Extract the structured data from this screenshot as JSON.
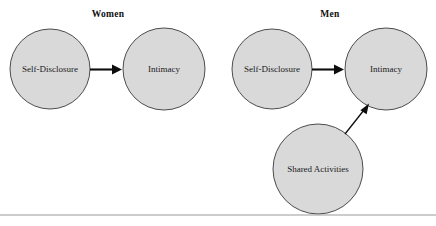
{
  "figure": {
    "background_color": "#ffffff",
    "node_fill_color": "#d9d9d9",
    "node_stroke_color": "#3a3a3a",
    "arrow_color": "#0d0d0d",
    "rule_color": "#9a9a9a"
  },
  "panels": [
    {
      "key": "women",
      "title": "Women",
      "nodes": [
        {
          "key": "self_disclosure",
          "label": "Self-Disclosure"
        },
        {
          "key": "intimacy",
          "label": "Intimacy"
        }
      ],
      "edges": [
        {
          "key": "self_disclosure_to_intimacy",
          "from": "Self-Disclosure",
          "to": "Intimacy"
        }
      ]
    },
    {
      "key": "men",
      "title": "Men",
      "nodes": [
        {
          "key": "self_disclosure",
          "label": "Self-Disclosure"
        },
        {
          "key": "intimacy",
          "label": "Intimacy"
        },
        {
          "key": "shared_activities",
          "label": "Shared Activities"
        }
      ],
      "edges": [
        {
          "key": "self_disclosure_to_intimacy",
          "from": "Self-Disclosure",
          "to": "Intimacy"
        },
        {
          "key": "shared_activities_to_intimacy",
          "from": "Shared Activities",
          "to": "Intimacy"
        }
      ]
    }
  ]
}
